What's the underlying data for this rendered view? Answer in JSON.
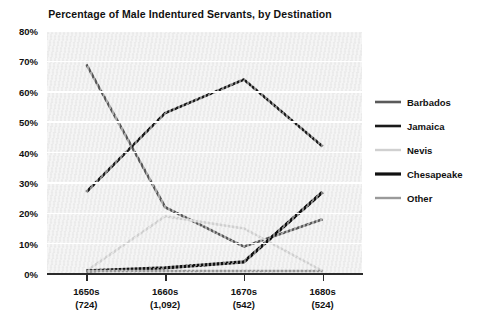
{
  "chart_data": {
    "type": "line",
    "title": "Percentage of Male Indentured Servants, by Destination",
    "xlabel": "",
    "ylabel": "",
    "ylim": [
      0,
      80
    ],
    "ytick_labels": [
      "0%",
      "10%",
      "20%",
      "30%",
      "40%",
      "50%",
      "60%",
      "70%",
      "80%"
    ],
    "ytick_values": [
      0,
      10,
      20,
      30,
      40,
      50,
      60,
      70,
      80
    ],
    "grid": true,
    "legend_position": "right",
    "categories": [
      "1650s",
      "1660s",
      "1670s",
      "1680s"
    ],
    "category_counts": [
      "(724)",
      "(1,092)",
      "(542)",
      "(524)"
    ],
    "series": [
      {
        "name": "Barbados",
        "color": "#5a5a5a",
        "width": 2.6,
        "values": [
          69,
          22,
          9,
          18
        ]
      },
      {
        "name": "Jamaica",
        "color": "#1a1a1a",
        "width": 2.6,
        "values": [
          27,
          53,
          64,
          42
        ]
      },
      {
        "name": "Nevis",
        "color": "#d0d0d0",
        "width": 2.4,
        "values": [
          1,
          19,
          15,
          1
        ]
      },
      {
        "name": "Chesapeake",
        "color": "#111111",
        "width": 3.2,
        "values": [
          1,
          2,
          4,
          27
        ]
      },
      {
        "name": "Other",
        "color": "#9a9a9a",
        "width": 2.4,
        "values": [
          1,
          1,
          1,
          1
        ]
      }
    ]
  }
}
